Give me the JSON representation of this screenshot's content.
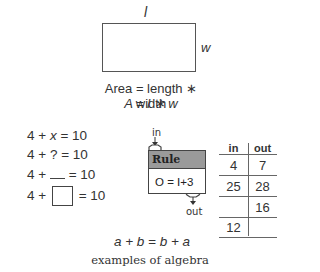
{
  "area_diagram": {
    "length_label": "l",
    "width_label": "w",
    "formula_words": "Area = length ∗ width",
    "formula_symbols": "A = l ∗ w"
  },
  "equations": [
    {
      "prefix": "4 + ",
      "unknown": "x",
      "unknown_style": "variable",
      "suffix": " = 10"
    },
    {
      "prefix": "4 + ",
      "unknown": "?",
      "unknown_style": "question-mark",
      "suffix": " = 10"
    },
    {
      "prefix": "4 + ",
      "unknown": "",
      "unknown_style": "blank-line",
      "suffix": " = 10"
    },
    {
      "prefix": "4 + ",
      "unknown": "",
      "unknown_style": "empty-box",
      "suffix": " = 10"
    }
  ],
  "function_machine": {
    "input_label": "in",
    "output_label": "out",
    "title": "Rule",
    "rule": "O = I+3",
    "header_color": "#9a9a9a"
  },
  "io_table": {
    "headers": [
      "in",
      "out"
    ],
    "rows": [
      [
        "4",
        "7"
      ],
      [
        "25",
        "28"
      ],
      [
        "",
        "16"
      ],
      [
        "12",
        ""
      ]
    ]
  },
  "commutative": "a + b = b + a",
  "caption": "examples of algebra"
}
